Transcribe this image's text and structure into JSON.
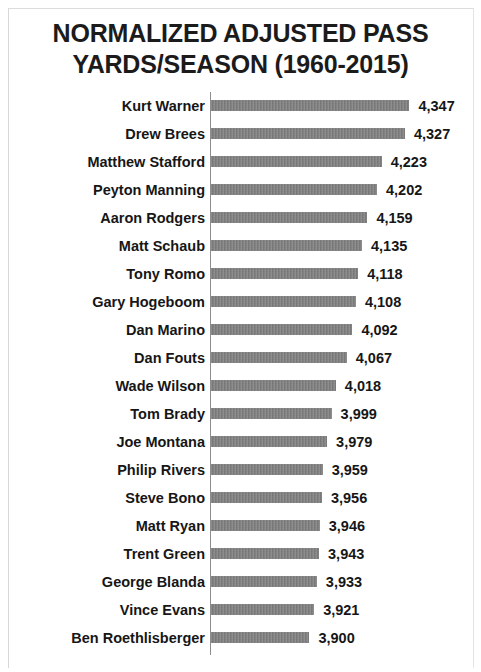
{
  "chart_data": {
    "type": "bar",
    "orientation": "horizontal",
    "title": "NORMALIZED ADJUSTED PASS YARDS/SEASON (1960-2015)",
    "title_lines": [
      "NORMALIZED ADJUSTED PASS",
      "YARDS/SEASON (1960-2015)"
    ],
    "xlabel": "",
    "ylabel": "",
    "grid": false,
    "legend": false,
    "bar_color": "#7b7b7b",
    "axis_color": "#8c8c8c",
    "text_color": "#161616",
    "background_color": "#ffffff",
    "xlim": [
      3460,
      4460
    ],
    "value_format": "comma-separated integer",
    "categories": [
      "Kurt Warner",
      "Drew Brees",
      "Matthew Stafford",
      "Peyton Manning",
      "Aaron Rodgers",
      "Matt Schaub",
      "Tony Romo",
      "Gary Hogeboom",
      "Dan Marino",
      "Dan Fouts",
      "Wade Wilson",
      "Tom Brady",
      "Joe Montana",
      "Philip Rivers",
      "Steve Bono",
      "Matt Ryan",
      "Trent Green",
      "George Blanda",
      "Vince Evans",
      "Ben Roethlisberger"
    ],
    "values": [
      4347,
      4327,
      4223,
      4202,
      4159,
      4135,
      4118,
      4108,
      4092,
      4067,
      4018,
      3999,
      3979,
      3959,
      3956,
      3946,
      3943,
      3933,
      3921,
      3900
    ],
    "value_labels": [
      "4,347",
      "4,327",
      "4,223",
      "4,202",
      "4,159",
      "4,135",
      "4,118",
      "4,108",
      "4,092",
      "4,067",
      "4,018",
      "3,999",
      "3,979",
      "3,959",
      "3,956",
      "3,946",
      "3,943",
      "3,933",
      "3,921",
      "3,900"
    ]
  }
}
